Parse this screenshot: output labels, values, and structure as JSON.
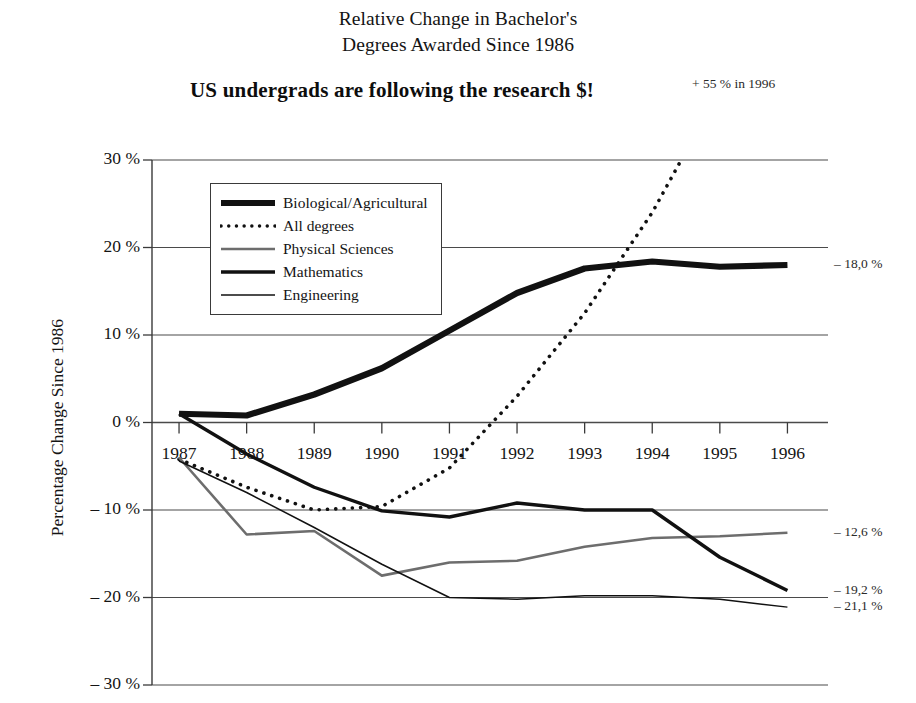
{
  "figure": {
    "title_line1": "Relative Change in Bachelor's",
    "title_line2": "Degrees Awarded Since 1986",
    "headline": "US undergrads are following the research $!",
    "peak_callout": "+ 55 % in 1996"
  },
  "axes": {
    "y_title": "Percentage Change Since 1986",
    "y_ticks": [
      "30 %",
      "20 %",
      "10 %",
      "0 %",
      "– 10 %",
      "– 20 %",
      "– 30 %"
    ],
    "x_ticks": [
      "1987",
      "1988",
      "1989",
      "1990",
      "1991",
      "1992",
      "1993",
      "1994",
      "1995",
      "1996"
    ]
  },
  "legend": {
    "items": [
      {
        "label": "Biological/Agricultural",
        "style": "thick-black"
      },
      {
        "label": "All degrees",
        "style": "dotted-black"
      },
      {
        "label": "Physical Sciences",
        "style": "medium-gray"
      },
      {
        "label": "Mathematics",
        "style": "thick-black-thin"
      },
      {
        "label": "Engineering",
        "style": "thin-black"
      }
    ]
  },
  "end_labels": [
    {
      "text": "– 18,0 %",
      "series": "Biological/Agricultural"
    },
    {
      "text": "– 12,6 %",
      "series": "Physical Sciences"
    },
    {
      "text": "– 19,2 %",
      "series": "Mathematics"
    },
    {
      "text": "– 21,1 %",
      "series": "Engineering"
    }
  ],
  "colors": {
    "axis": "#3a3a3a",
    "gridline": "#4a4a4a",
    "black": "#111111",
    "gray": "#6d6d6d",
    "text": "#141414"
  },
  "chart_data": {
    "type": "line",
    "title": "Relative Change in Bachelor's Degrees Awarded Since 1986",
    "subtitle": "US undergrads are following the research $!",
    "xlabel": "",
    "ylabel": "Percentage Change Since 1986",
    "x": [
      1987,
      1988,
      1989,
      1990,
      1991,
      1992,
      1993,
      1994,
      1995,
      1996
    ],
    "xlim": [
      1986.6,
      1996.6
    ],
    "ylim": [
      -30,
      30
    ],
    "yticks": [
      30,
      20,
      10,
      0,
      -10,
      -20,
      -30
    ],
    "grid": true,
    "legend_position": "upper-left-inside",
    "annotations": [
      {
        "text": "+ 55 % in 1996",
        "note": "All degrees line exits top of plot near 1994.5 and reaches +55 % in 1996"
      },
      {
        "text": "– 18,0 %",
        "note": "Biological/Agricultural end value label at right edge"
      },
      {
        "text": "– 12,6 %",
        "note": "Physical Sciences end value label at right edge"
      },
      {
        "text": "– 19,2 %",
        "note": "Mathematics end value label at right edge"
      },
      {
        "text": "– 21,1 %",
        "note": "Engineering end value label at right edge"
      }
    ],
    "series": [
      {
        "name": "Biological/Agricultural",
        "style": "thick solid black",
        "values": [
          1.0,
          0.8,
          3.2,
          6.2,
          10.5,
          14.8,
          17.6,
          18.4,
          17.8,
          18.0
        ]
      },
      {
        "name": "All degrees",
        "style": "dotted black",
        "values": [
          -4.2,
          -7.4,
          -10.0,
          -9.6,
          -5.2,
          3.0,
          12.5,
          24.0,
          38.0,
          55.0
        ]
      },
      {
        "name": "Physical Sciences",
        "style": "medium solid gray",
        "values": [
          -4.0,
          -12.8,
          -12.4,
          -17.5,
          -16.0,
          -15.8,
          -14.2,
          -13.2,
          -13.0,
          -12.6
        ]
      },
      {
        "name": "Mathematics",
        "style": "thick solid black",
        "values": [
          1.0,
          -3.6,
          -7.4,
          -10.1,
          -10.8,
          -9.2,
          -10.0,
          -10.0,
          -15.4,
          -19.2
        ]
      },
      {
        "name": "Engineering",
        "style": "thin solid black",
        "values": [
          -4.4,
          -8.0,
          -12.0,
          -16.2,
          -20.0,
          -20.2,
          -19.8,
          -19.8,
          -20.2,
          -21.1
        ]
      }
    ]
  }
}
